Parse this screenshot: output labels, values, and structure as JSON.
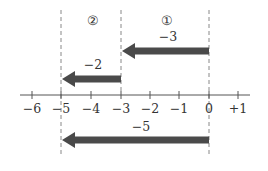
{
  "diagram": {
    "type": "number-line-addition",
    "region_labels": [
      "②",
      "①"
    ],
    "arrows": [
      {
        "id": "arrow-1",
        "label": "−3",
        "from": 0,
        "to": -3
      },
      {
        "id": "arrow-2",
        "label": "−2",
        "from": -3,
        "to": -5
      },
      {
        "id": "arrow-result",
        "label": "−5",
        "from": 0,
        "to": -5
      }
    ],
    "axis": {
      "ticks": [
        "−6",
        "−5",
        "−4",
        "−3",
        "−2",
        "−1",
        "0",
        "+1"
      ],
      "range": [
        -6,
        1
      ]
    },
    "colors": {
      "arrow": "#4a4a4a",
      "axis": "#555555",
      "dashed": "#888888"
    }
  }
}
